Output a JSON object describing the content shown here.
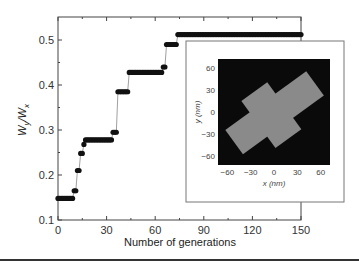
{
  "chart_data": {
    "type": "scatter",
    "title": "",
    "xlabel": "Number of generations",
    "ylabel": "W_y/W_x",
    "xlim": [
      0,
      150
    ],
    "ylim": [
      0.1,
      0.55
    ],
    "xticks": [
      0,
      30,
      60,
      90,
      120,
      150
    ],
    "yticks": [
      0.1,
      0.2,
      0.3,
      0.4,
      0.5
    ],
    "grid": false,
    "legend": null,
    "series": [
      {
        "name": "W_y/W_x",
        "steps": [
          {
            "x_start": 0,
            "x_end": 9,
            "y": 0.148
          },
          {
            "x_start": 10,
            "x_end": 11,
            "y": 0.165
          },
          {
            "x_start": 12,
            "x_end": 13,
            "y": 0.21
          },
          {
            "x_start": 14,
            "x_end": 15,
            "y": 0.248
          },
          {
            "x_start": 16,
            "x_end": 16,
            "y": 0.268
          },
          {
            "x_start": 17,
            "x_end": 33,
            "y": 0.278
          },
          {
            "x_start": 34,
            "x_end": 36,
            "y": 0.295
          },
          {
            "x_start": 37,
            "x_end": 43,
            "y": 0.385
          },
          {
            "x_start": 44,
            "x_end": 64,
            "y": 0.428
          },
          {
            "x_start": 65,
            "x_end": 66,
            "y": 0.44
          },
          {
            "x_start": 67,
            "x_end": 73,
            "y": 0.49
          },
          {
            "x_start": 74,
            "x_end": 150,
            "y": 0.512
          }
        ]
      }
    ],
    "inset": {
      "type": "heatmap",
      "xlabel": "x (nm)",
      "ylabel": "y (nm)",
      "xticks": [
        -60,
        -30,
        0,
        30,
        60
      ],
      "yticks": [
        60,
        30,
        0,
        -30,
        -60
      ],
      "xlim": [
        -72,
        72
      ],
      "ylim": [
        -72,
        72
      ],
      "description": "Grey cross-shaped structure rotated ~35° on black background"
    }
  },
  "axis": {
    "x_title": "Number of generations",
    "y_title_main": "W",
    "y_title_sub1": "y",
    "y_title_slash": "/W",
    "y_title_sub2": "x",
    "x_tick_labels": [
      "0",
      "30",
      "60",
      "90",
      "120",
      "150"
    ],
    "y_tick_labels": [
      "0.1",
      "0.2",
      "0.3",
      "0.4",
      "0.5"
    ]
  },
  "inset": {
    "x_title": "x (nm)",
    "y_title": "y (nm)",
    "x_tick_labels": [
      "−60",
      "−30",
      "0",
      "30",
      "60"
    ],
    "y_tick_labels": [
      "60",
      "30",
      "0",
      "−30",
      "−60"
    ]
  },
  "colors": {
    "marker": "#111111",
    "line": "#888888",
    "inset_bg": "#0a0a0a",
    "inset_shape": "#8a8a8a",
    "axis": "#333333"
  }
}
